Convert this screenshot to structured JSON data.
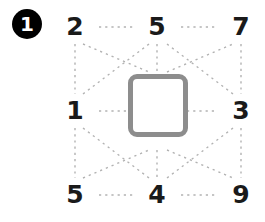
{
  "badge": {
    "label": "1"
  },
  "colors": {
    "badge_fill": "#000000",
    "badge_text": "#ffffff",
    "number_text": "#1a1a1a",
    "guide_line": "#b2b2b2",
    "focus_square_border": "#8d8d8d",
    "background": "#ffffff"
  },
  "diagram": {
    "type": "numeric-lattice",
    "rows": 3,
    "columns": 3,
    "nodes": [
      {
        "row": 0,
        "col": 0,
        "label": "2"
      },
      {
        "row": 0,
        "col": 1,
        "label": "5"
      },
      {
        "row": 0,
        "col": 2,
        "label": "7"
      },
      {
        "row": 1,
        "col": 0,
        "label": "1"
      },
      {
        "row": 1,
        "col": 2,
        "label": "3"
      },
      {
        "row": 2,
        "col": 0,
        "label": "5"
      },
      {
        "row": 2,
        "col": 1,
        "label": "4"
      },
      {
        "row": 2,
        "col": 2,
        "label": "9"
      }
    ],
    "center_cell": {
      "label": "",
      "style": "rounded-square-outline",
      "highlighted": true
    },
    "guides": {
      "style": "dotted",
      "horizontal": true,
      "vertical": true,
      "diagonal": true
    }
  }
}
